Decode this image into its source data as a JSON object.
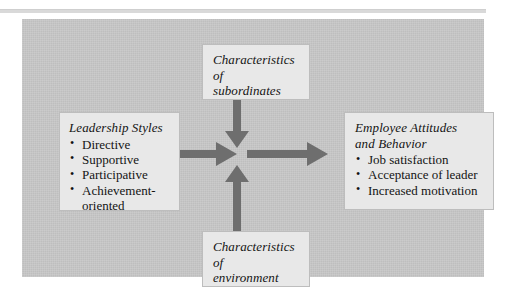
{
  "figure": {
    "type": "path-goal-leadership-model-diagram",
    "background_color": "#c6c6c6",
    "box_fill_color": "#e8e8e8",
    "arrow_color": "#6e6e6e",
    "text_color": "#141414"
  },
  "boxes": {
    "leadership_styles": {
      "title": "Leadership Styles",
      "items": [
        "Directive",
        "Supportive",
        "Participative",
        "Achievement-\noriented"
      ]
    },
    "characteristics_of_subordinates": {
      "title": "Characteristics\nof\nsubordinates",
      "items": []
    },
    "characteristics_of_environment": {
      "title": "Characteristics\nof\nenvironment",
      "items": []
    },
    "employee_attitudes": {
      "title": "Employee Attitudes\nand Behavior",
      "items": [
        "Job satisfaction",
        "Acceptance of leader",
        "Increased motivation"
      ]
    }
  },
  "arrows": [
    {
      "name": "styles-to-center",
      "direction": "right"
    },
    {
      "name": "subordinates-to-center",
      "direction": "down"
    },
    {
      "name": "environment-to-center",
      "direction": "up"
    },
    {
      "name": "center-to-outcomes",
      "direction": "right"
    }
  ]
}
